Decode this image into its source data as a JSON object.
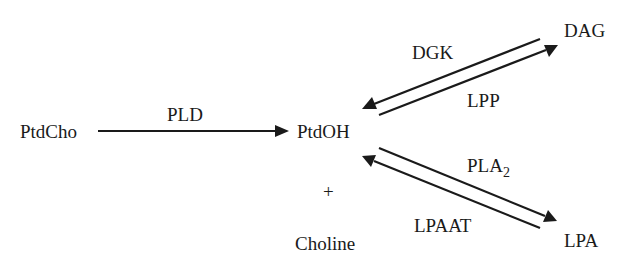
{
  "diagram": {
    "nodes": {
      "ptdcho": "PtdCho",
      "ptdoh": "PtdOH",
      "dag": "DAG",
      "lpa": "LPA",
      "plus": "+",
      "choline": "Choline"
    },
    "enzymes": {
      "pld": "PLD",
      "dgk": "DGK",
      "lpp": "LPP",
      "pla2_base": "PLA",
      "pla2_sub": "2",
      "lpaat": "LPAAT"
    },
    "edges": [
      {
        "from": "PtdCho",
        "to": "PtdOH",
        "label": "PLD"
      },
      {
        "from": "DAG",
        "to": "PtdOH",
        "label": "DGK"
      },
      {
        "from": "PtdOH",
        "to": "DAG",
        "label": "LPP"
      },
      {
        "from": "PtdOH",
        "to": "LPA",
        "label": "PLA2"
      },
      {
        "from": "LPA",
        "to": "PtdOH",
        "label": "LPAAT"
      }
    ],
    "colors": {
      "ink": "#1a1a1a",
      "background": "#ffffff"
    }
  }
}
